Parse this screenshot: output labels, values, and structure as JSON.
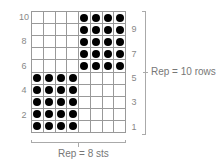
{
  "chart": {
    "columns": 8,
    "rows": 10,
    "dot_color": "#000000",
    "grid_color": "#999999",
    "pattern": [
      [
        0,
        0,
        0,
        0,
        1,
        1,
        1,
        1
      ],
      [
        0,
        0,
        0,
        0,
        1,
        1,
        1,
        1
      ],
      [
        0,
        0,
        0,
        0,
        1,
        1,
        1,
        1
      ],
      [
        0,
        0,
        0,
        0,
        1,
        1,
        1,
        1
      ],
      [
        0,
        0,
        0,
        0,
        1,
        1,
        1,
        1
      ],
      [
        1,
        1,
        1,
        1,
        0,
        0,
        0,
        0
      ],
      [
        1,
        1,
        1,
        1,
        0,
        0,
        0,
        0
      ],
      [
        1,
        1,
        1,
        1,
        0,
        0,
        0,
        0
      ],
      [
        1,
        1,
        1,
        1,
        0,
        0,
        0,
        0
      ],
      [
        1,
        1,
        1,
        1,
        0,
        0,
        0,
        0
      ]
    ],
    "left_row_numbers": [
      "10",
      "8",
      "6",
      "4",
      "2"
    ],
    "right_row_numbers": [
      "9",
      "7",
      "5",
      "3",
      "1"
    ],
    "row_rep_label": "Rep = 10 rows",
    "stitch_rep_label": "Rep = 8 sts"
  }
}
